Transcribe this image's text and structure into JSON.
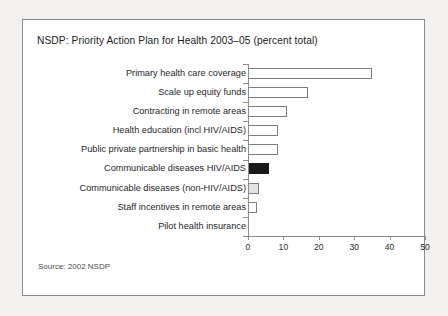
{
  "panel": {
    "title": "NSDP: Priority Action Plan for Health 2003–05 (percent total)",
    "source": "Source: 2002 NSDP"
  },
  "chart_data": {
    "type": "bar",
    "orientation": "horizontal",
    "title": "NSDP: Priority Action Plan for Health 2003–05 (percent total)",
    "xlabel": "",
    "ylabel": "",
    "xlim": [
      0,
      50
    ],
    "xticks": [
      0,
      10,
      20,
      30,
      40,
      50
    ],
    "xtick_labels": [
      "0",
      "10",
      "20",
      "30",
      "40",
      "50"
    ],
    "grid": false,
    "legend": false,
    "categories": [
      "Primary health care coverage",
      "Scale up equity funds",
      "Contracting in remote areas",
      "Health education (incl HIV/AIDS)",
      "Public private partnership in basic health",
      "Communicable diseases HIV/AIDS",
      "Communicable diseases (non-HIV/AIDS)",
      "Staff incentives in remote areas",
      "Pilot health insurance"
    ],
    "values": [
      35,
      17,
      11,
      8.5,
      8.5,
      6,
      3,
      2.5,
      0
    ],
    "bar_styles": [
      "white",
      "white",
      "white",
      "white",
      "white",
      "dark",
      "light",
      "white",
      "none"
    ],
    "colors": {
      "bar_white_fill": "#ffffff",
      "bar_light_fill": "#e2e2e2",
      "bar_dark_fill": "#1a1a1a",
      "bar_outline": "#7d7d7d",
      "axis": "#8c8c8c",
      "text": "#1f1f1f",
      "panel_background": "#ffffff",
      "page_background": "#f2f1ef",
      "panel_border": "#8c8c8c"
    }
  }
}
